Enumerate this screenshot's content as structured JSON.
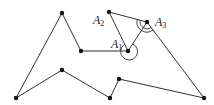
{
  "diagram": {
    "type": "polygon-triangulation",
    "vertices": [
      {
        "id": "v1",
        "x": 16,
        "y": 98
      },
      {
        "id": "v2",
        "x": 62,
        "y": 13
      },
      {
        "id": "v3",
        "x": 81,
        "y": 51
      },
      {
        "id": "A1",
        "x": 128,
        "y": 51
      },
      {
        "id": "A2",
        "x": 109,
        "y": 12
      },
      {
        "id": "A3",
        "x": 147,
        "y": 22
      },
      {
        "id": "v7",
        "x": 204,
        "y": 98
      },
      {
        "id": "v8",
        "x": 119,
        "y": 79
      },
      {
        "id": "v9",
        "x": 110,
        "y": 98
      },
      {
        "id": "v10",
        "x": 62,
        "y": 70
      }
    ],
    "polygon_path": "M16,98 L62,13 L81,51 L128,51 L109,12 L147,22 L204,98 L119,79 L110,98 L62,70 Z",
    "diagonal_path": "M128,51 L147,22",
    "labels": {
      "A1": {
        "base": "A",
        "sub": "1"
      },
      "A2": {
        "base": "A",
        "sub": "2"
      },
      "A3": {
        "base": "A",
        "sub": "3"
      }
    },
    "angle_marks": {
      "A1_reflex_arc": "M124.5,44.4 A9,9 0 1 0 132.9,43.4",
      "A3_arc_inner": "M140.2,20.2 A7,7 0 0 0 143.2,28",
      "A3_arc_inner2": "M143.2,28 A7,7 0 0 0 151.2,27.6",
      "A3_arc_outer": "M137.3,19.5 A10,10 0 0 0 141.5,30.4",
      "A3_arc_outer2": "M141.5,30.4 A10,10 0 0 0 153,30"
    }
  }
}
